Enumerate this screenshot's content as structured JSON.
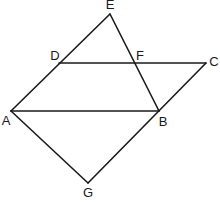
{
  "diagram": {
    "type": "geometry-figure",
    "points": {
      "E": {
        "label": "E",
        "x": 110,
        "y": 14,
        "lx": 110,
        "ly": 5
      },
      "D": {
        "label": "D",
        "x": 59,
        "y": 63,
        "lx": 55,
        "ly": 57
      },
      "F": {
        "label": "F",
        "x": 134,
        "y": 63,
        "lx": 140,
        "ly": 57
      },
      "C": {
        "label": "C",
        "x": 206,
        "y": 63,
        "lx": 213,
        "ly": 63
      },
      "A": {
        "label": "A",
        "x": 11,
        "y": 111,
        "lx": 6,
        "ly": 122
      },
      "B": {
        "label": "B",
        "x": 159,
        "y": 111,
        "lx": 163,
        "ly": 123
      },
      "G": {
        "label": "G",
        "x": 88,
        "y": 183,
        "lx": 88,
        "ly": 194
      }
    },
    "segments": [
      {
        "from": "A",
        "to": "E",
        "name": "segment-ae"
      },
      {
        "from": "E",
        "to": "B",
        "name": "segment-eb"
      },
      {
        "from": "D",
        "to": "C",
        "name": "segment-dc"
      },
      {
        "from": "C",
        "to": "G",
        "name": "segment-cg"
      },
      {
        "from": "A",
        "to": "B",
        "name": "segment-ab"
      },
      {
        "from": "A",
        "to": "G",
        "name": "segment-ag"
      }
    ],
    "labels": {
      "E": "E",
      "D": "D",
      "F": "F",
      "C": "C",
      "A": "A",
      "B": "B",
      "G": "G"
    },
    "colors": {
      "stroke": "#1a1a1a",
      "background": "#ffffff"
    }
  }
}
